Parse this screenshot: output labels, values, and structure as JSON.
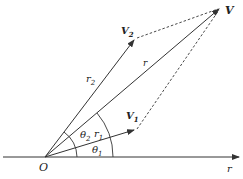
{
  "diagram": {
    "colors": {
      "line": "#333333",
      "text": "#222222",
      "background": "#ffffff"
    },
    "origin": {
      "label": "O",
      "x": 45,
      "y": 157
    },
    "axis": {
      "label": "r",
      "x1": 3,
      "x2": 240,
      "y": 157
    },
    "points": {
      "V": {
        "label": "V",
        "sub": "",
        "x": 220,
        "y": 8
      },
      "V2": {
        "label": "V",
        "sub": "2",
        "x": 135,
        "y": 39
      },
      "V1": {
        "label": "V",
        "sub": "1",
        "x": 135,
        "y": 130
      }
    },
    "vector_labels": {
      "r": {
        "label": "r",
        "sub": ""
      },
      "r1": {
        "label": "r",
        "sub": "1"
      },
      "r2": {
        "label": "r",
        "sub": "2"
      }
    },
    "angles": {
      "theta1": {
        "label": "θ",
        "sub": "1"
      },
      "theta2": {
        "label": "θ",
        "sub": "2"
      }
    }
  }
}
